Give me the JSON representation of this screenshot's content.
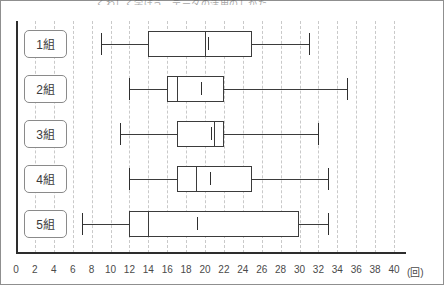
{
  "title": {
    "text": "くわしく学ぼう　データの活用のしかた"
  },
  "axis": {
    "x_unit_label": "(回)",
    "x_ticks": [
      0,
      2,
      4,
      6,
      8,
      10,
      12,
      14,
      16,
      18,
      20,
      22,
      24,
      26,
      28,
      30,
      32,
      34,
      36,
      38,
      40
    ],
    "x_min": 0,
    "x_max": 40,
    "x_tick_step": 2,
    "grid": "dashed-vertical-light",
    "grid_color": "#c9c9c9",
    "axis_color": "#2d2d2d"
  },
  "group_labels": [
    "1組",
    "2組",
    "3組",
    "4組",
    "5組"
  ],
  "chart_data": {
    "type": "box",
    "title": "くわしく学ぼう　データの活用のしかた",
    "xlabel": "(回)",
    "ylabel": "",
    "xlim": [
      0,
      40
    ],
    "grid": true,
    "legend": "none",
    "orientation": "horizontal",
    "categories": [
      "1組",
      "2組",
      "3組",
      "4組",
      "5組"
    ],
    "boxes": [
      {
        "label": "1組",
        "min": 9,
        "q1": 14,
        "median": 20,
        "q3": 25,
        "max": 31,
        "mean": 20.3
      },
      {
        "label": "2組",
        "min": 12,
        "q1": 16,
        "median": 17,
        "q3": 22,
        "max": 35,
        "mean": 19.6
      },
      {
        "label": "3組",
        "min": 11,
        "q1": 17,
        "median": 21,
        "q3": 22,
        "max": 32,
        "mean": 20.6
      },
      {
        "label": "4組",
        "min": 12,
        "q1": 17,
        "median": 19,
        "q3": 25,
        "max": 33,
        "mean": 20.5
      },
      {
        "label": "5組",
        "min": 7,
        "q1": 12,
        "median": 14,
        "q3": 30,
        "max": 33,
        "mean": 19.2
      }
    ]
  },
  "style": {
    "box_stroke": "#3b3b3b",
    "whisker_stroke": "#3b3b3b",
    "cap_stroke": "#2f2f2f",
    "box_fill": "#ffffff",
    "chip_border": "#8a8a8a",
    "frame_border": "#8f8f8f"
  }
}
